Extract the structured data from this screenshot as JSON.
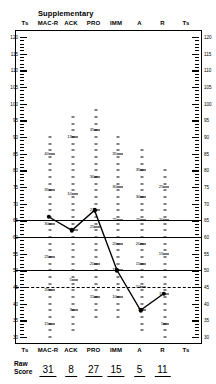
{
  "header": {
    "supplementary_title": "Supplementary",
    "columns": [
      "Ts",
      "MAC-R",
      "ACK",
      "PRO",
      "IMM",
      "A",
      "R",
      "Ts"
    ]
  },
  "footer": {
    "columns": [
      "Ts",
      "MAC-R",
      "ACK",
      "PRO",
      "IMM",
      "A",
      "R",
      "Ts"
    ],
    "raw_label_line1": "Raw",
    "raw_label_line2": "Score",
    "raw_scores": [
      "31",
      "8",
      "27",
      "15",
      "5",
      "11"
    ]
  },
  "axis": {
    "ticks": [
      "120",
      "115",
      "110",
      "105",
      "100",
      "95",
      "90",
      "85",
      "80",
      "75",
      "70",
      "65",
      "60",
      "55",
      "50",
      "45",
      "40",
      "35",
      "30"
    ],
    "min": 30,
    "max": 120
  },
  "reference_lines": [
    {
      "t": 65,
      "style": "solid"
    },
    {
      "t": 60,
      "style": "solid"
    },
    {
      "t": 50,
      "style": "solid"
    },
    {
      "t": 45,
      "style": "dashed"
    }
  ],
  "chart_data": {
    "type": "line",
    "title": "Supplementary",
    "xlabel": "",
    "ylabel": "Ts",
    "ylim": [
      30,
      120
    ],
    "grid": true,
    "categories": [
      "MAC-R",
      "ACK",
      "PRO",
      "IMM",
      "A",
      "R"
    ],
    "series": [
      {
        "name": "T score",
        "values": [
          66,
          62,
          68,
          50,
          38,
          43
        ]
      },
      {
        "name": "Raw score",
        "values": [
          31,
          8,
          27,
          15,
          5,
          11
        ]
      }
    ],
    "annotations": [
      "reference line at T=65",
      "reference line at T=60",
      "reference line at T=50"
    ]
  },
  "columns_scale": {
    "MAC-R": {
      "numbers": [
        {
          "raw": 40,
          "t": 85
        },
        {
          "raw": 35,
          "t": 74
        },
        {
          "raw": 30,
          "t": 64
        },
        {
          "raw": 25,
          "t": 54
        },
        {
          "raw": 20,
          "t": 44
        },
        {
          "raw": 15,
          "t": 34
        }
      ]
    },
    "ACK": {
      "numbers": [
        {
          "raw": 13,
          "t": 90
        },
        {
          "raw": 10,
          "t": 73
        },
        {
          "raw": 8,
          "t": 62
        },
        {
          "raw": 5,
          "t": 47
        },
        {
          "raw": 3,
          "t": 38
        }
      ]
    },
    "PRO": {
      "numbers": [
        {
          "raw": 35,
          "t": 92
        },
        {
          "raw": 30,
          "t": 78
        },
        {
          "raw": 27,
          "t": 68
        },
        {
          "raw": 25,
          "t": 63
        },
        {
          "raw": 20,
          "t": 52
        },
        {
          "raw": 15,
          "t": 42
        }
      ]
    },
    "IMM": {
      "numbers": [
        {
          "raw": 35,
          "t": 85
        },
        {
          "raw": 30,
          "t": 75
        },
        {
          "raw": 25,
          "t": 65
        },
        {
          "raw": 20,
          "t": 58
        },
        {
          "raw": 15,
          "t": 50
        },
        {
          "raw": 10,
          "t": 42
        }
      ]
    },
    "A": {
      "numbers": [
        {
          "raw": 35,
          "t": 80
        },
        {
          "raw": 30,
          "t": 72
        },
        {
          "raw": 25,
          "t": 65
        },
        {
          "raw": 20,
          "t": 58
        },
        {
          "raw": 15,
          "t": 52
        },
        {
          "raw": 10,
          "t": 45
        },
        {
          "raw": 5,
          "t": 38
        }
      ]
    },
    "R": {
      "numbers": [
        {
          "raw": 25,
          "t": 75
        },
        {
          "raw": 20,
          "t": 65
        },
        {
          "raw": 15,
          "t": 55
        },
        {
          "raw": 11,
          "t": 43
        },
        {
          "raw": 5,
          "t": 34
        }
      ]
    }
  }
}
